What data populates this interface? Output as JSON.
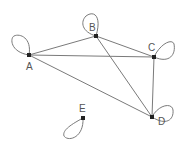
{
  "diagram": {
    "type": "undirected-graph-with-self-loops",
    "background": "#ffffff",
    "edge_color": "#7a7a7a",
    "node_color": "#222222",
    "label_color": "#555555",
    "nodes": [
      {
        "id": "A",
        "label": "A",
        "x": 29,
        "y": 55,
        "label_x": 26,
        "label_y": 70,
        "loop": "M29,55 C10,52 10,38 14,36 C20,33 32,38 29,55"
      },
      {
        "id": "B",
        "label": "B",
        "x": 96,
        "y": 36,
        "label_x": 89,
        "label_y": 31,
        "loop": "M96,36 C82,32 80,22 86,16 C94,10 102,16 96,36"
      },
      {
        "id": "C",
        "label": "C",
        "x": 154,
        "y": 57,
        "label_x": 148,
        "label_y": 51,
        "loop": "M154,57 C160,44 172,38 174,44 C176,54 170,64 154,57"
      },
      {
        "id": "D",
        "label": "D",
        "x": 152,
        "y": 117,
        "label_x": 158,
        "label_y": 125,
        "loop": "M152,117 C158,105 172,102 173,110 C174,120 166,126 152,117"
      },
      {
        "id": "E",
        "label": "E",
        "x": 83,
        "y": 118,
        "label_x": 79,
        "label_y": 112,
        "loop": "M83,118 C72,124 62,130 64,136 C68,142 84,138 83,118"
      }
    ],
    "edges": [
      {
        "from": "A",
        "to": "B"
      },
      {
        "from": "A",
        "to": "C"
      },
      {
        "from": "A",
        "to": "D"
      },
      {
        "from": "B",
        "to": "C"
      },
      {
        "from": "B",
        "to": "D"
      },
      {
        "from": "C",
        "to": "D"
      }
    ]
  }
}
